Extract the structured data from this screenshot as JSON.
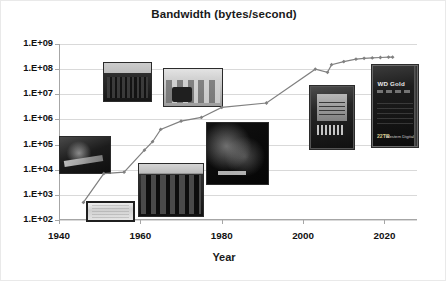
{
  "chart_data": {
    "type": "line",
    "title": "Bandwidth (bytes/second)",
    "xlabel": "Year",
    "ylabel": "",
    "xlim": [
      1940,
      2028
    ],
    "ylim": [
      100,
      1000000000
    ],
    "yscale": "log",
    "grid": true,
    "legend": "none",
    "ytick_labels": [
      "1.E+09",
      "1.E+08",
      "1.E+07",
      "1.E+06",
      "1.E+05",
      "1.E+04",
      "1.E+03",
      "1.E+02"
    ],
    "ytick_values": [
      1000000000,
      100000000,
      10000000,
      1000000,
      100000,
      10000,
      1000,
      100
    ],
    "xtick_labels": [
      "1940",
      "1960",
      "1980",
      "2000",
      "2020"
    ],
    "xtick_values": [
      1940,
      1960,
      1980,
      2000,
      2020
    ],
    "series": [
      {
        "name": "Bandwidth",
        "marker": "diamond",
        "color": "#808080",
        "x": [
          1946,
          1951,
          1956,
          1961,
          1963,
          1965,
          1970,
          1975,
          1980,
          1991,
          2003,
          2006,
          2007,
          2010,
          2013,
          2015,
          2017,
          2019,
          2021,
          2022
        ],
        "y": [
          500,
          7000,
          8000,
          60000,
          130000,
          400000,
          850000,
          1200000,
          3000000,
          4500000,
          100000000,
          75000000,
          150000000,
          200000000,
          250000000,
          270000000,
          280000000,
          290000000,
          300000000,
          300000000
        ]
      }
    ]
  },
  "photos": [
    {
      "id": "tape-drive",
      "label": "vintage-tape-drive-photo"
    },
    {
      "id": "crt-display",
      "label": "williams-tube-display-photo"
    },
    {
      "id": "console-rack",
      "label": "console-rack-photo"
    },
    {
      "id": "cabinet-bank",
      "label": "mainframe-cabinet-bank-photo"
    },
    {
      "id": "computer-room",
      "label": "computer-room-photo"
    },
    {
      "id": "disk-pack",
      "label": "disk-pack-internals-photo"
    },
    {
      "id": "hdd-35",
      "label": "hard-disk-drive-photo"
    },
    {
      "id": "wd-gold",
      "label": "wd-gold-drive-photo"
    }
  ],
  "wd_drive": {
    "brand": "WD Gold",
    "capacity": "22TB",
    "maker": "Western Digital"
  }
}
